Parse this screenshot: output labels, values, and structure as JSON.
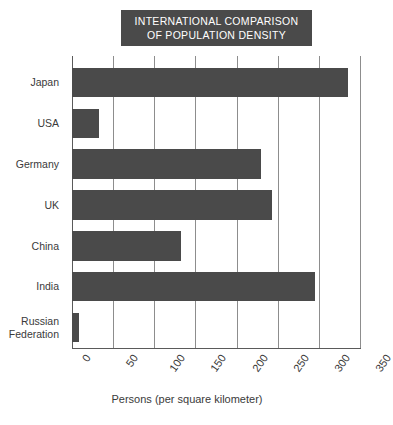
{
  "chart_data": {
    "type": "bar",
    "orientation": "horizontal",
    "title": "INTERNATIONAL COMPARISON OF POPULATION DENSITY",
    "title_lines": [
      "INTERNATIONAL COMPARISON",
      "OF POPULATION DENSITY"
    ],
    "categories": [
      "Japan",
      "USA",
      "Germany",
      "UK",
      "China",
      "India",
      "Russian Federation"
    ],
    "values": [
      335,
      33,
      230,
      243,
      133,
      295,
      8
    ],
    "xlabel": "Persons (per square kilometer)",
    "ylabel": "",
    "xlim": [
      0,
      350
    ],
    "xticks": [
      0,
      50,
      100,
      150,
      200,
      250,
      300,
      350
    ],
    "xtick_labels": [
      "0",
      "50",
      "100",
      "150",
      "200",
      "250",
      "300",
      "350"
    ],
    "grid": true,
    "grid_axis": "x",
    "legend": false,
    "bar_color": "#4a4a4a",
    "title_background": "#4a4a4a",
    "title_color": "#ffffff",
    "grid_color": "#8d8d8d",
    "axis_color": "#5a5a5a",
    "background": "#ffffff"
  }
}
